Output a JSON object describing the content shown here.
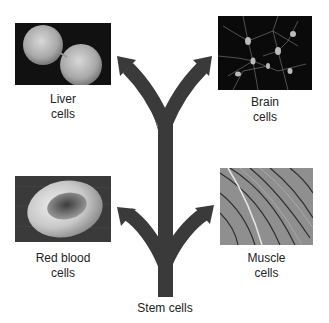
{
  "diagram": {
    "source": {
      "label": "Stem cells",
      "icon": "branching-arrow-icon"
    },
    "targets": [
      {
        "id": "liver",
        "label_line1": "Liver",
        "label_line2": "cells",
        "image": "liver-cells-micrograph",
        "position": "top-left"
      },
      {
        "id": "brain",
        "label_line1": "Brain",
        "label_line2": "cells",
        "image": "brain-cells-micrograph",
        "position": "top-right"
      },
      {
        "id": "rbc",
        "label_line1": "Red blood",
        "label_line2": "cells",
        "image": "red-blood-cell-micrograph",
        "position": "bottom-left"
      },
      {
        "id": "muscle",
        "label_line1": "Muscle",
        "label_line2": "cells",
        "image": "muscle-cells-micrograph",
        "position": "bottom-right"
      }
    ],
    "colors": {
      "arrow": "#3a3a3a",
      "background": "#ffffff",
      "text": "#222222"
    }
  }
}
